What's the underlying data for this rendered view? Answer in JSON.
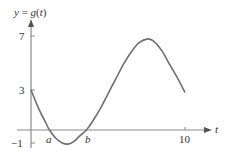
{
  "chart_data": {
    "type": "line",
    "title": "y = g(t)",
    "xlabel": "t",
    "ylabel": "y = g(t)",
    "xlim": [
      -0.5,
      11.8
    ],
    "ylim": [
      -1.6,
      8.4
    ],
    "grid": false,
    "legend": null,
    "x_ticks": [
      {
        "value": 10,
        "label": "10"
      }
    ],
    "y_ticks": [
      {
        "value": 7,
        "label": "7"
      },
      {
        "value": 3,
        "label": "3"
      },
      {
        "value": -1,
        "label": "−1"
      }
    ],
    "annotations": [
      {
        "label": "a",
        "x": 1.2,
        "y": 0,
        "note": "first zero of g"
      },
      {
        "label": "b",
        "x": 3.6,
        "y": 0,
        "note": "second zero of g"
      }
    ],
    "series": [
      {
        "name": "g(t)",
        "x": [
          0,
          0.5,
          1.0,
          1.2,
          1.6,
          2.0,
          2.4,
          2.8,
          3.2,
          3.6,
          4.0,
          4.5,
          5.0,
          5.5,
          6.0,
          6.5,
          7.0,
          7.6,
          8.0,
          8.5,
          9.0,
          9.5,
          10
        ],
        "y": [
          3.0,
          1.6,
          0.45,
          0.0,
          -0.6,
          -0.95,
          -1.05,
          -0.85,
          -0.4,
          0.0,
          0.65,
          1.6,
          2.7,
          3.8,
          4.9,
          5.8,
          6.5,
          6.8,
          6.6,
          5.9,
          4.9,
          3.9,
          2.8
        ]
      }
    ]
  },
  "labels": {
    "y_axis": "y = g(t)",
    "t_axis": "t",
    "tick_7": "7",
    "tick_3": "3",
    "tick_neg1": "−1",
    "tick_10": "10",
    "point_a": "a",
    "point_b": "b"
  },
  "colors": {
    "axis": "#8a8a8a",
    "curve": "#6e6e6e",
    "text": "#333333"
  }
}
